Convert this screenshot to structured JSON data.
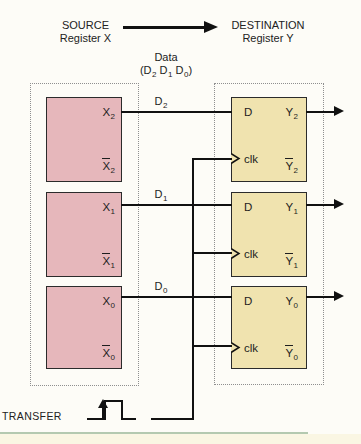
{
  "header": {
    "source_line1": "SOURCE",
    "source_line2": "Register X",
    "dest_line1": "DESTINATION",
    "dest_line2": "Register Y",
    "data_title": "Data",
    "bits": {
      "p0": "(D",
      "s0": "2",
      "p1": " D",
      "s1": "1",
      "p2": " D",
      "s2": "0",
      "p3": ")"
    }
  },
  "rows": [
    {
      "wire_label": {
        "base": "D",
        "sub": "2"
      },
      "source": {
        "out": {
          "base": "X",
          "sub": "2"
        },
        "out_bar": {
          "base": "X",
          "sub": "2"
        }
      },
      "ff": {
        "d": "D",
        "clk": "clk",
        "out": {
          "base": "Y",
          "sub": "2"
        },
        "out_bar": {
          "base": "Y",
          "sub": "2"
        }
      }
    },
    {
      "wire_label": {
        "base": "D",
        "sub": "1"
      },
      "source": {
        "out": {
          "base": "X",
          "sub": "1"
        },
        "out_bar": {
          "base": "X",
          "sub": "1"
        }
      },
      "ff": {
        "d": "D",
        "clk": "clk",
        "out": {
          "base": "Y",
          "sub": "1"
        },
        "out_bar": {
          "base": "Y",
          "sub": "1"
        }
      }
    },
    {
      "wire_label": {
        "base": "D",
        "sub": "0"
      },
      "source": {
        "out": {
          "base": "X",
          "sub": "0"
        },
        "out_bar": {
          "base": "X",
          "sub": "0"
        }
      },
      "ff": {
        "d": "D",
        "clk": "clk",
        "out": {
          "base": "Y",
          "sub": "0"
        },
        "out_bar": {
          "base": "Y",
          "sub": "0"
        }
      }
    }
  ],
  "transfer": {
    "label": "TRANSFER"
  },
  "colors": {
    "background": "#fdfcf7",
    "register_fill": "#e6b7bb",
    "flipflop_fill": "#f0e3af",
    "border_dark": "#2b2b2b",
    "dashed_border": "#8f8f8f",
    "wire": "#141414",
    "page_rule_green": "#b4c9b0",
    "page_strip_cream": "#faf6e3"
  }
}
